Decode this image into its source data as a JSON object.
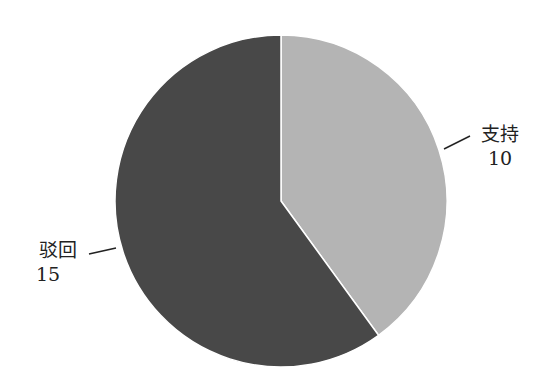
{
  "chart_data": {
    "type": "pie",
    "title": "",
    "categories": [
      "支持",
      "驳回"
    ],
    "values": [
      10,
      15
    ],
    "colors": [
      "#b4b4b4",
      "#484848"
    ],
    "start_angle": "12 o'clock",
    "direction": "clockwise",
    "legend": "none (leader-line labels)"
  },
  "labels": {
    "support": {
      "name": "支持",
      "value": "10"
    },
    "reject": {
      "name": "驳回",
      "value": "15"
    }
  }
}
